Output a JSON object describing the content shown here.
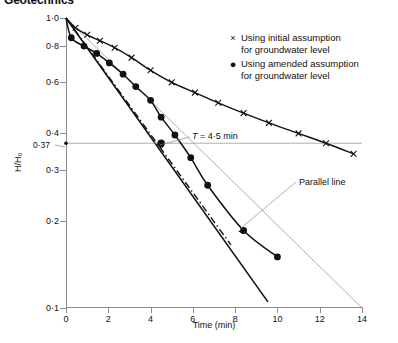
{
  "runhead": "Geotechnics",
  "chart_data": {
    "type": "line",
    "title": "",
    "xlabel": "Time (min)",
    "ylabel": "H/H0",
    "ylabel_display": "H/H₀",
    "yscale": "log",
    "xlim": [
      0,
      14
    ],
    "ylim": [
      0.1,
      1.0
    ],
    "xticks": [
      0,
      2,
      4,
      6,
      8,
      10,
      12,
      14
    ],
    "xticklabels": [
      "0",
      "2",
      "4",
      "6",
      "8",
      "10",
      "12",
      "14"
    ],
    "yticks": [
      1.0,
      0.8,
      0.6,
      0.4,
      0.3,
      0.2,
      0.1
    ],
    "yticklabels": [
      "1·0",
      "0·8",
      "0·6",
      "0·4",
      "0·3",
      "0·2",
      "0·1"
    ],
    "grid": false,
    "legend_position": "upper right",
    "series": [
      {
        "name": "Using initial assumption for groundwater level",
        "marker": "x",
        "style": "solid",
        "points": [
          {
            "x": 0.0,
            "y": 1.0
          },
          {
            "x": 0.45,
            "y": 0.925
          },
          {
            "x": 1.0,
            "y": 0.875
          },
          {
            "x": 1.6,
            "y": 0.835
          },
          {
            "x": 2.3,
            "y": 0.79
          },
          {
            "x": 3.1,
            "y": 0.73
          },
          {
            "x": 4.0,
            "y": 0.66
          },
          {
            "x": 5.0,
            "y": 0.6
          },
          {
            "x": 6.1,
            "y": 0.553
          },
          {
            "x": 7.2,
            "y": 0.51
          },
          {
            "x": 8.4,
            "y": 0.47
          },
          {
            "x": 9.6,
            "y": 0.435
          },
          {
            "x": 11.0,
            "y": 0.4
          },
          {
            "x": 12.3,
            "y": 0.37
          },
          {
            "x": 13.6,
            "y": 0.34
          }
        ]
      },
      {
        "name": "Using amended assumption for groundwater level",
        "marker": "o",
        "style": "solid",
        "points": [
          {
            "x": 0.0,
            "y": 1.0
          },
          {
            "x": 0.25,
            "y": 0.855
          },
          {
            "x": 0.85,
            "y": 0.8
          },
          {
            "x": 1.45,
            "y": 0.755
          },
          {
            "x": 2.05,
            "y": 0.7
          },
          {
            "x": 2.7,
            "y": 0.64
          },
          {
            "x": 3.3,
            "y": 0.58
          },
          {
            "x": 4.0,
            "y": 0.52
          },
          {
            "x": 4.5,
            "y": 0.455
          },
          {
            "x": 5.15,
            "y": 0.395
          },
          {
            "x": 5.9,
            "y": 0.33
          },
          {
            "x": 6.7,
            "y": 0.265
          },
          {
            "x": 8.4,
            "y": 0.185
          },
          {
            "x": 10.0,
            "y": 0.15
          }
        ]
      }
    ],
    "reference_lines": [
      {
        "name": "parallel-line",
        "style": "dashdot",
        "from": {
          "x": 0.0,
          "y": 1.0
        },
        "to": {
          "x": 7.8,
          "y": 0.165
        }
      },
      {
        "name": "steep-straight-line",
        "style": "solid",
        "from": {
          "x": 0.0,
          "y": 1.0
        },
        "to": {
          "x": 9.55,
          "y": 0.105
        }
      },
      {
        "name": "thin-straight-line",
        "style": "thin",
        "from": {
          "x": 0.0,
          "y": 1.0
        },
        "to": {
          "x": 14.0,
          "y": 0.1
        }
      },
      {
        "name": "horizontal-0p37-line",
        "style": "thin",
        "value_y": 0.37,
        "from_x": 0.0,
        "to_x": 14.0
      }
    ],
    "annotations": [
      {
        "name": "T-value",
        "text": "T = 4·5 min",
        "italic_prefix": "T",
        "x": 4.5,
        "y": 0.37
      },
      {
        "name": "parallel-line-label",
        "text": "Parallel line",
        "x": 7.9,
        "y": 0.22
      },
      {
        "name": "y-value-0p37",
        "text": "0·37",
        "x": 0.0,
        "y": 0.37
      }
    ]
  },
  "legend": {
    "items": [
      {
        "marker": "×",
        "marker_name": "cross-marker",
        "line1": "Using initial assumption",
        "line2": "for groundwater level"
      },
      {
        "marker": "●",
        "marker_name": "filled-circle-marker",
        "line1": "Using amended assumption",
        "line2": "for groundwater level"
      }
    ]
  },
  "colors": {
    "data": "#111111",
    "axis": "#8c8c8c",
    "thin_line": "#9a9a9a",
    "background": "#ffffff"
  }
}
